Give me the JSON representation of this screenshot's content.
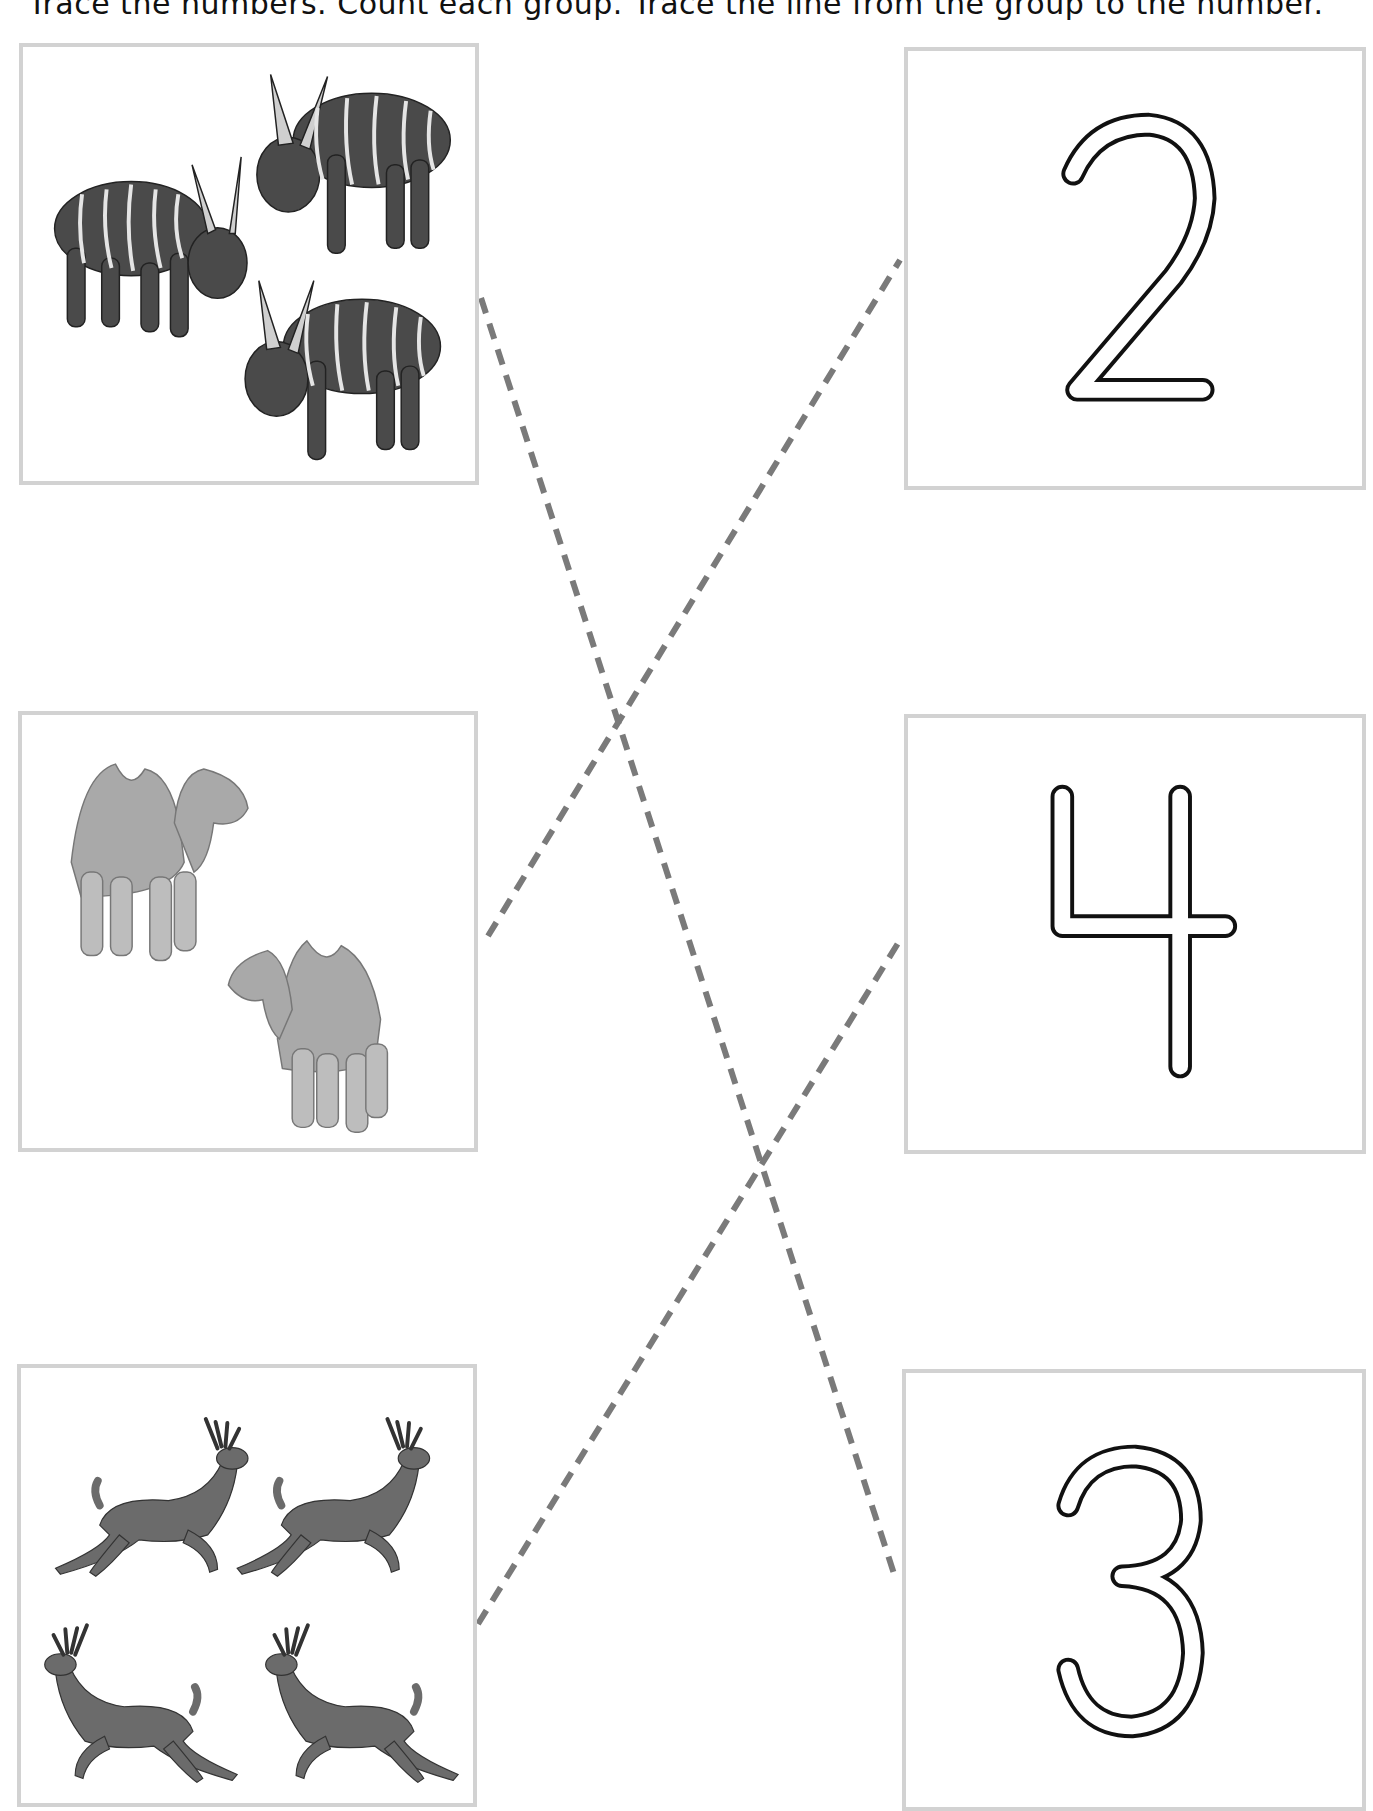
{
  "instructions": "Trace the numbers. Count each group. Trace the line from the group to the number.",
  "colors": {
    "box_border": "#d2d2d2",
    "dashed_line": "#7a7a7a",
    "numeral_outline": "#111111",
    "bongo_body": "#4a4a4a",
    "camel_body": "#a9a9a9",
    "deer_body": "#6b6b6b"
  },
  "groups": [
    {
      "animal": "bongo antelope",
      "count": 3,
      "label": "3 bongo antelopes"
    },
    {
      "animal": "camel",
      "count": 2,
      "label": "2 camels"
    },
    {
      "animal": "deer",
      "count": 4,
      "label": "4 deer"
    }
  ],
  "numbers": [
    {
      "value": "2"
    },
    {
      "value": "4"
    },
    {
      "value": "3"
    }
  ],
  "matches": [
    {
      "from_group": "bongo antelope",
      "to_number": "3"
    },
    {
      "from_group": "camel",
      "to_number": "2"
    },
    {
      "from_group": "deer",
      "to_number": "4"
    }
  ]
}
